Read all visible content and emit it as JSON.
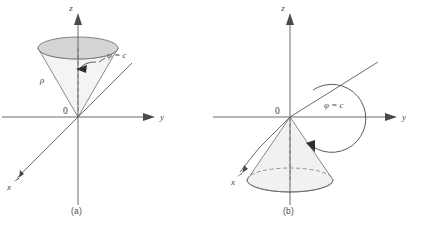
{
  "figure": {
    "background": "#ffffff",
    "line_color": "#5a5a5a",
    "cap_fill": "#d5d5d5",
    "body_fill": "#f2f2f2",
    "text_color": "#4a4a4a"
  },
  "panel_a": {
    "caption": "(a)",
    "axis_z": "z",
    "axis_y": "y",
    "axis_x": "x",
    "origin": "0",
    "label_rho": "ρ",
    "label_phi": "φ = c"
  },
  "panel_b": {
    "caption": "(b)",
    "axis_z": "z",
    "axis_y": "y",
    "axis_x": "x",
    "origin": "0",
    "label_phi": "φ = c"
  }
}
